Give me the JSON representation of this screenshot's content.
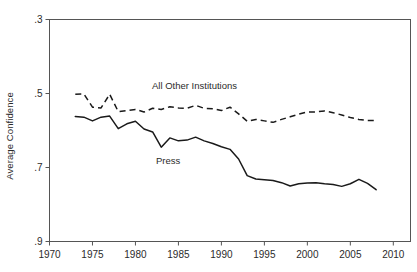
{
  "figure": {
    "ylabel": "Average Confidence",
    "background": "#ffffff",
    "line_color": "#1a1a1a"
  },
  "annotations": {
    "other": "All Other Institutions",
    "press": "Press"
  },
  "axis": {
    "x_ticks": [
      "1970",
      "1975",
      "1980",
      "1985",
      "1990",
      "1995",
      "2000",
      "2005",
      "2010"
    ],
    "y_ticks": [
      ".9",
      ".7",
      ".5",
      ".3"
    ]
  },
  "chart_data": {
    "type": "line",
    "title": "",
    "xlabel": "",
    "ylabel": "Average Confidence",
    "xlim": [
      1970,
      2012
    ],
    "ylim": [
      0.3,
      0.9
    ],
    "grid": false,
    "legend": "inline-annotations",
    "x_ticks": [
      1970,
      1975,
      1980,
      1985,
      1990,
      1995,
      2000,
      2005,
      2010
    ],
    "y_ticks": [
      0.3,
      0.5,
      0.7,
      0.9
    ],
    "x": [
      1973,
      1974,
      1975,
      1976,
      1977,
      1978,
      1979,
      1980,
      1981,
      1982,
      1983,
      1984,
      1985,
      1986,
      1987,
      1988,
      1989,
      1990,
      1991,
      1992,
      1993,
      1994,
      1995,
      1996,
      1997,
      1998,
      1999,
      2000,
      2001,
      2002,
      2003,
      2004,
      2005,
      2006,
      2007,
      2008
    ],
    "series": [
      {
        "name": "All Other Institutions",
        "style": "dashed",
        "values": [
          0.698,
          0.699,
          0.663,
          0.661,
          0.698,
          0.651,
          0.654,
          0.657,
          0.65,
          0.66,
          0.657,
          0.664,
          0.661,
          0.66,
          0.668,
          0.66,
          0.659,
          0.654,
          0.663,
          0.645,
          0.625,
          0.63,
          0.626,
          0.622,
          0.63,
          0.637,
          0.644,
          0.65,
          0.65,
          0.653,
          0.648,
          0.642,
          0.635,
          0.63,
          0.627,
          0.627
        ]
      },
      {
        "name": "Press",
        "style": "solid",
        "values": [
          0.638,
          0.636,
          0.626,
          0.636,
          0.639,
          0.605,
          0.618,
          0.625,
          0.604,
          0.596,
          0.555,
          0.58,
          0.572,
          0.574,
          0.582,
          0.572,
          0.565,
          0.556,
          0.549,
          0.523,
          0.478,
          0.469,
          0.467,
          0.465,
          0.459,
          0.45,
          0.456,
          0.458,
          0.459,
          0.456,
          0.454,
          0.449,
          0.456,
          0.468,
          0.457,
          0.44
        ]
      }
    ]
  }
}
